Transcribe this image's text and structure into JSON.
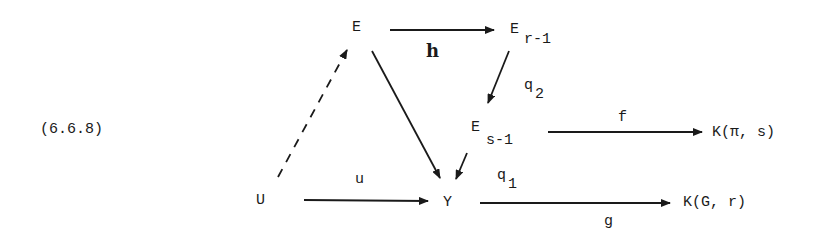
{
  "equation_number": "(6.6.8)",
  "nodes": {
    "E": {
      "label": "E"
    },
    "E_r_minus_1": {
      "base": "E",
      "subscript": "r-1"
    },
    "E_s_minus_1": {
      "base": "E",
      "subscript": "s-1"
    },
    "K_pi_s": {
      "label": "K(π, s)"
    },
    "U": {
      "label": "U"
    },
    "Y": {
      "label": "Y"
    },
    "K_G_r": {
      "label": "K(G, r)"
    }
  },
  "arrows": {
    "h": {
      "label": "h",
      "from": "E",
      "to": "E_r-1",
      "style": "solid"
    },
    "q2": {
      "base": "q",
      "subscript": "2",
      "from": "E_r-1",
      "to": "E_s-1",
      "style": "solid"
    },
    "f": {
      "label": "f",
      "from": "E_s-1",
      "to": "K(π, s)",
      "style": "solid"
    },
    "u": {
      "label": "u",
      "from": "U",
      "to": "Y",
      "style": "solid"
    },
    "q1": {
      "base": "q",
      "subscript": "1",
      "from": "E_s-1",
      "to": "Y",
      "style": "solid"
    },
    "g": {
      "label": "g",
      "from": "Y",
      "to": "K(G, r)",
      "style": "solid"
    },
    "E_to_Y": {
      "label": "",
      "from": "E",
      "to": "Y",
      "style": "solid"
    },
    "U_to_E": {
      "label": "",
      "from": "U",
      "to": "E",
      "style": "dashed"
    }
  },
  "colors": {
    "ink": "#1a1a1a",
    "background": "#ffffff"
  }
}
